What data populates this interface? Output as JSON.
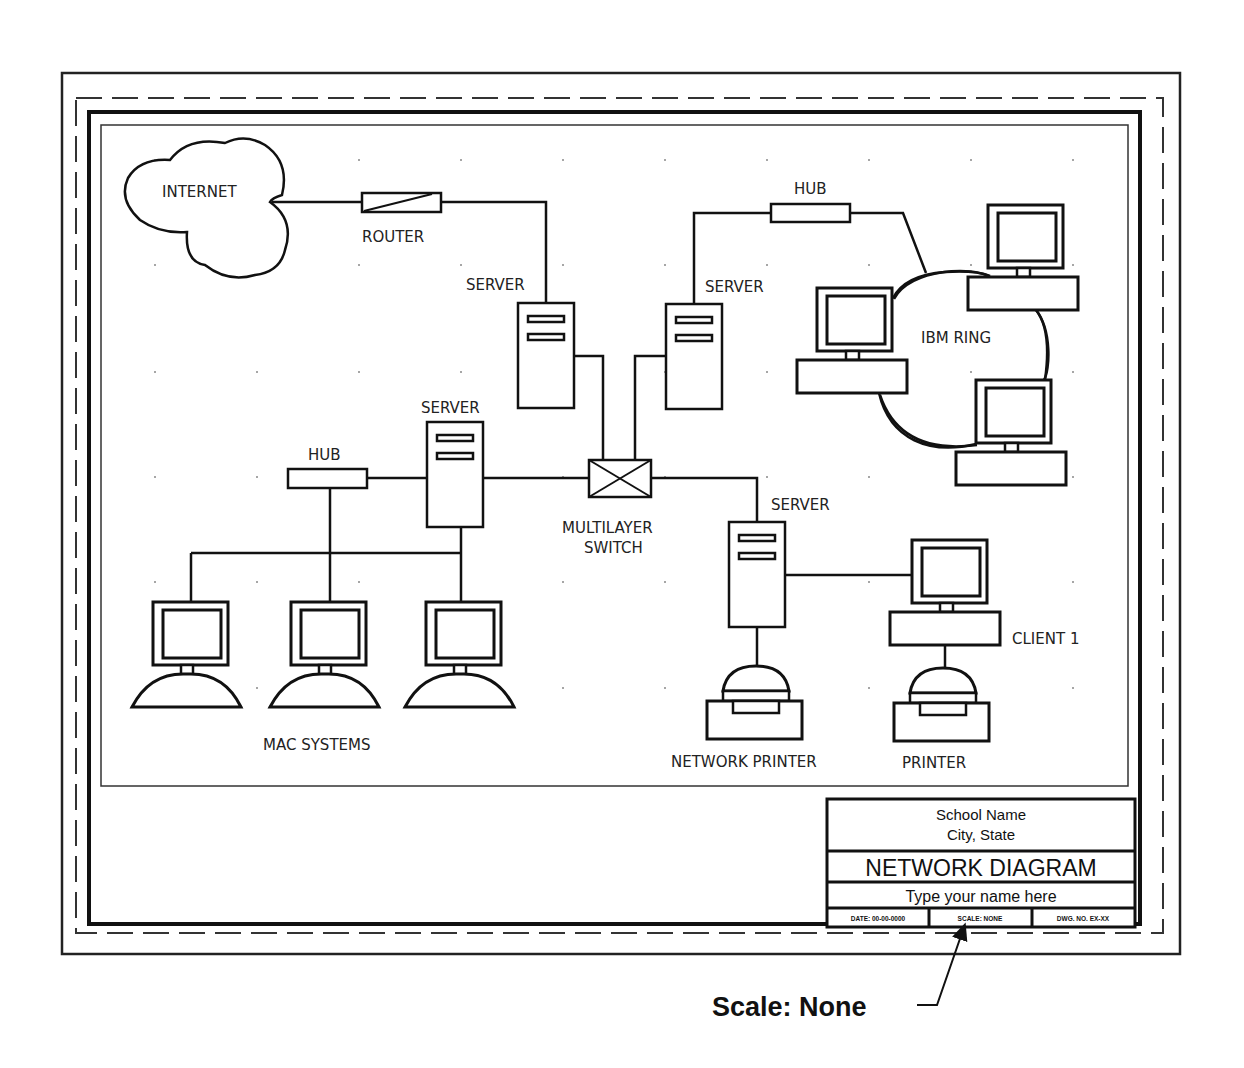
{
  "diagram": {
    "labels": {
      "internet": "INTERNET",
      "router": "ROUTER",
      "server_top_left": "SERVER",
      "server_top_right": "SERVER",
      "server_left": "SERVER",
      "server_right": "SERVER",
      "hub_top": "HUB",
      "hub_left": "HUB",
      "ibm_ring": "IBM RING",
      "switch_line1": "MULTILAYER",
      "switch_line2": "SWITCH",
      "mac_systems": "MAC SYSTEMS",
      "client1": "CLIENT 1",
      "network_printer": "NETWORK PRINTER",
      "printer": "PRINTER"
    },
    "nodes": [
      {
        "id": "internet",
        "type": "cloud"
      },
      {
        "id": "router",
        "type": "router"
      },
      {
        "id": "server-top-left",
        "type": "server"
      },
      {
        "id": "server-top-right",
        "type": "server"
      },
      {
        "id": "hub-top",
        "type": "hub"
      },
      {
        "id": "ibm-pc-1",
        "type": "ibm-pc"
      },
      {
        "id": "ibm-pc-2",
        "type": "ibm-pc"
      },
      {
        "id": "ibm-pc-3",
        "type": "ibm-pc"
      },
      {
        "id": "multilayer-switch",
        "type": "switch"
      },
      {
        "id": "server-left",
        "type": "server"
      },
      {
        "id": "hub-left",
        "type": "hub"
      },
      {
        "id": "mac-1",
        "type": "mac"
      },
      {
        "id": "mac-2",
        "type": "mac"
      },
      {
        "id": "mac-3",
        "type": "mac"
      },
      {
        "id": "server-right",
        "type": "server"
      },
      {
        "id": "client-1",
        "type": "pc"
      },
      {
        "id": "network-printer",
        "type": "printer"
      },
      {
        "id": "printer",
        "type": "printer"
      }
    ],
    "edges": [
      [
        "internet",
        "router"
      ],
      [
        "router",
        "server-top-left"
      ],
      [
        "server-top-left",
        "multilayer-switch"
      ],
      [
        "server-top-right",
        "multilayer-switch"
      ],
      [
        "server-top-right",
        "hub-top"
      ],
      [
        "hub-top",
        "ibm-ring"
      ],
      [
        "multilayer-switch",
        "server-left"
      ],
      [
        "multilayer-switch",
        "server-right"
      ],
      [
        "server-left",
        "hub-left"
      ],
      [
        "hub-left",
        "mac-2"
      ],
      [
        "server-left",
        "mac-3"
      ],
      [
        "hub-left",
        "mac-1"
      ],
      [
        "server-right",
        "client-1"
      ],
      [
        "server-right",
        "network-printer"
      ],
      [
        "client-1",
        "printer"
      ]
    ]
  },
  "title_block": {
    "school_name": "School Name",
    "city_state": "City, State",
    "title": "NETWORK DIAGRAM",
    "name_placeholder": "Type your name here",
    "date": "DATE: 00-00-0000",
    "scale": "SCALE: NONE",
    "dwg_no": "DWG. NO. EX-XX"
  },
  "callout": {
    "text": "Scale: None"
  },
  "colors": {
    "ink": "#111111",
    "paper": "#ffffff"
  }
}
